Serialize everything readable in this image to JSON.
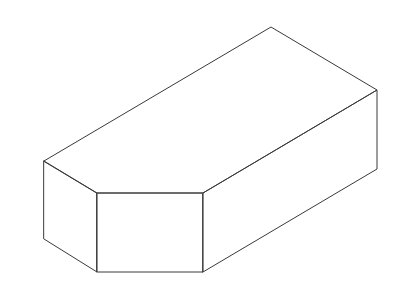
{
  "figure": {
    "width": 405,
    "height": 302,
    "background": "#ffffff",
    "line_color": "#3a3a3a",
    "vertices": {
      "top_apex": [
        271,
        27
      ],
      "right_top": [
        377,
        90
      ],
      "right_bottom": [
        377,
        169
      ],
      "left_top": [
        44,
        161
      ],
      "left_bottom": [
        44,
        239
      ],
      "front_left_top": [
        97,
        193
      ],
      "front_left_bottom": [
        97,
        272
      ],
      "front_right_top": [
        203,
        193
      ],
      "front_right_bottom": [
        203,
        272
      ]
    }
  }
}
